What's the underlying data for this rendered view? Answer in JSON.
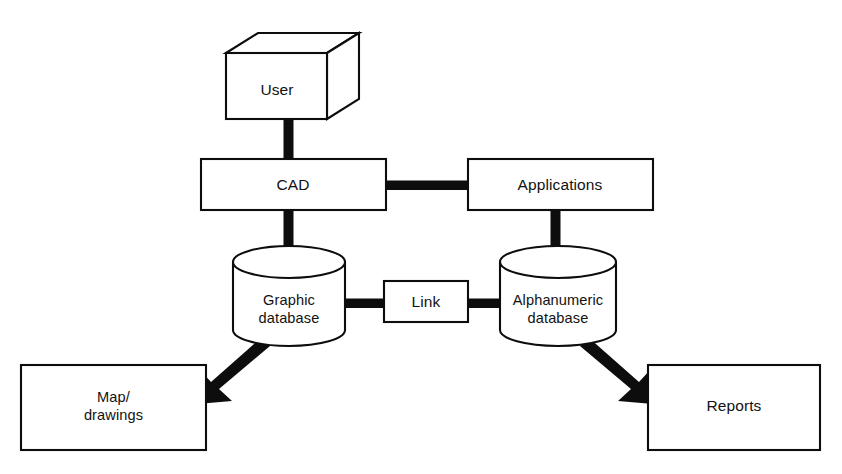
{
  "diagram": {
    "background_color": "#ffffff",
    "line_color": "#0d0d0d",
    "text_color": "#121212",
    "nodes": {
      "user": {
        "label": "User",
        "shape": "cube-3d"
      },
      "cad": {
        "label": "CAD",
        "shape": "rectangle"
      },
      "applications": {
        "label": "Applications",
        "shape": "rectangle"
      },
      "graphic_database": {
        "label_line1": "Graphic",
        "label_line2": "database",
        "shape": "cylinder"
      },
      "link": {
        "label": "Link",
        "shape": "rectangle"
      },
      "alphanumeric_database": {
        "label_line1": "Alphanumeric",
        "label_line2": "database",
        "shape": "cylinder"
      },
      "map_drawings": {
        "label_line1": "Map/",
        "label_line2": "drawings",
        "shape": "rectangle"
      },
      "reports": {
        "label": "Reports",
        "shape": "rectangle"
      }
    },
    "connectors": [
      {
        "name": "user-to-cad",
        "from": "user",
        "to": "cad",
        "style": "thick-line",
        "direction": "none"
      },
      {
        "name": "cad-to-applications",
        "from": "cad",
        "to": "applications",
        "style": "thick-line",
        "direction": "none"
      },
      {
        "name": "cad-to-graphic-database",
        "from": "cad",
        "to": "graphic_database",
        "style": "thick-line",
        "direction": "none"
      },
      {
        "name": "applications-to-alphanumeric-database",
        "from": "applications",
        "to": "alphanumeric_database",
        "style": "thick-line",
        "direction": "none"
      },
      {
        "name": "graphic-database-to-link",
        "from": "graphic_database",
        "to": "link",
        "style": "thick-line",
        "direction": "none"
      },
      {
        "name": "link-to-alphanumeric-database",
        "from": "link",
        "to": "alphanumeric_database",
        "style": "thick-line",
        "direction": "none"
      },
      {
        "name": "graphic-database-to-map-drawings",
        "from": "graphic_database",
        "to": "map_drawings",
        "style": "thick-arrow",
        "direction": "to"
      },
      {
        "name": "alphanumeric-database-to-reports",
        "from": "alphanumeric_database",
        "to": "reports",
        "style": "thick-arrow",
        "direction": "to"
      }
    ]
  }
}
